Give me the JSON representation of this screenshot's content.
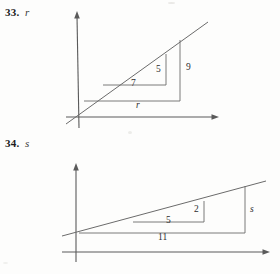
{
  "page": {
    "width": 280,
    "height": 274,
    "background_color": "#fdfdfc",
    "ink_color": "#555555",
    "text_color": "#1c1c1c"
  },
  "problems": [
    {
      "id": "33",
      "number_label": "33.",
      "variable_label": "r",
      "figure": {
        "type": "similar-right-triangles-on-axes",
        "axes": {
          "x_axis_label": "",
          "y_axis_label": "",
          "origin": [
            79,
            117
          ],
          "x_axis_arrow_tip": [
            219,
            117
          ],
          "y_axis_arrow_tip": [
            77,
            12
          ]
        },
        "line": {
          "name": "transversal-line",
          "start": [
            66,
            124
          ],
          "end": [
            208,
            22
          ]
        },
        "small_triangle": {
          "name": "inner-triangle",
          "vertices": [
            [
              103,
              85
            ],
            [
              166,
              85
            ],
            [
              166,
              54
            ]
          ],
          "base_label": "7",
          "height_label": "5"
        },
        "large_triangle": {
          "name": "outer-triangle",
          "vertices": [
            [
              84,
              101
            ],
            [
              180,
              101
            ],
            [
              180,
              40
            ]
          ],
          "base_label": "r",
          "height_label": "9"
        },
        "labels": [
          {
            "text": "7",
            "x": 133,
            "y": 85,
            "italic": false
          },
          {
            "text": "5",
            "x": 158,
            "y": 71,
            "italic": false
          },
          {
            "text": "9",
            "x": 188,
            "y": 69,
            "italic": false
          },
          {
            "text": "r",
            "x": 137,
            "y": 106,
            "italic": true
          }
        ]
      }
    },
    {
      "id": "34",
      "number_label": "34.",
      "variable_label": "s",
      "figure": {
        "type": "similar-right-triangles-on-axes",
        "axes": {
          "x_axis_label": "",
          "y_axis_label": "",
          "origin": [
            76,
            252
          ],
          "x_axis_arrow_tip": [
            270,
            252
          ],
          "y_axis_arrow_tip": [
            76,
            164
          ]
        },
        "line": {
          "name": "transversal-line",
          "start": [
            62,
            236
          ],
          "end": [
            266,
            181
          ]
        },
        "small_triangle": {
          "name": "inner-triangle",
          "vertices": [
            [
              133,
              222
            ],
            [
              204,
              222
            ],
            [
              204,
              201
            ]
          ],
          "base_label": "5",
          "height_label": "2"
        },
        "large_triangle": {
          "name": "outer-triangle",
          "vertices": [
            [
              79,
              233
            ],
            [
              245,
              233
            ],
            [
              245,
              186
            ]
          ],
          "base_label": "11",
          "height_label": "s"
        },
        "labels": [
          {
            "text": "5",
            "x": 168,
            "y": 222,
            "italic": false
          },
          {
            "text": "2",
            "x": 196,
            "y": 211,
            "italic": false
          },
          {
            "text": "s",
            "x": 252,
            "y": 211,
            "italic": true
          },
          {
            "text": "11",
            "x": 162,
            "y": 238,
            "italic": false
          }
        ]
      }
    }
  ]
}
